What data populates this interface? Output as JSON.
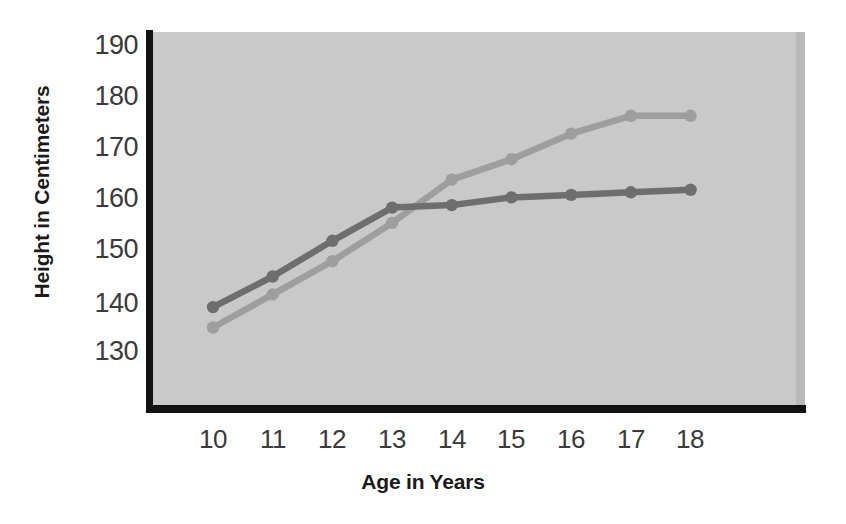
{
  "chart_data": {
    "type": "line",
    "title": "",
    "xlabel": "Age in Years",
    "ylabel": "Height in Centimeters",
    "x": [
      10,
      11,
      12,
      13,
      14,
      15,
      16,
      17,
      18
    ],
    "categories": [
      "10",
      "11",
      "12",
      "13",
      "14",
      "15",
      "16",
      "17",
      "18"
    ],
    "xlim": [
      9.3,
      18.7
    ],
    "ylim": [
      126,
      193
    ],
    "yticks": [
      130,
      140,
      150,
      160,
      170,
      180,
      190
    ],
    "ytick_labels": [
      "130",
      "140",
      "150",
      "160",
      "170",
      "180",
      "190"
    ],
    "xticks": [
      10,
      11,
      12,
      13,
      14,
      15,
      16,
      17,
      18
    ],
    "xtick_labels": [
      "10",
      "11",
      "12",
      "13",
      "14",
      "15",
      "16",
      "17",
      "18"
    ],
    "grid": false,
    "legend": "none",
    "plot_background_color": "#c9c9c9",
    "axis_color": "#111111",
    "series": [
      {
        "name": "series-dark",
        "color": "#6e6e6e",
        "marker": "circle",
        "values": [
          139,
          145,
          152,
          158.5,
          159,
          160.5,
          161,
          161.5,
          162
        ]
      },
      {
        "name": "series-light",
        "color": "#9e9e9e",
        "marker": "circle",
        "values": [
          135,
          141.5,
          148,
          155.5,
          164,
          168,
          173,
          176.5,
          176.5
        ]
      }
    ]
  }
}
